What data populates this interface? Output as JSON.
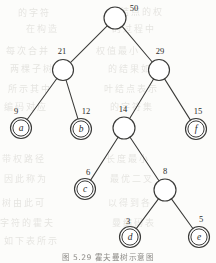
{
  "figure": {
    "caption": "图 5.29  霍夫曼树示意图",
    "kind": "huffman-tree-diagram"
  },
  "bleed_through": [
    {
      "text": "的字符",
      "x": 18,
      "y": 6
    },
    {
      "text": "结点的权",
      "x": 120,
      "y": 5
    },
    {
      "text": "在构造",
      "x": 26,
      "y": 22
    },
    {
      "text": "的过程中",
      "x": 112,
      "y": 22
    },
    {
      "text": "每次合并",
      "x": 6,
      "y": 44
    },
    {
      "text": "权值最小",
      "x": 96,
      "y": 44
    },
    {
      "text": "两棵子树",
      "x": 10,
      "y": 62
    },
    {
      "text": "的结果如",
      "x": 108,
      "y": 62
    },
    {
      "text": "所示其中",
      "x": 8,
      "y": 82
    },
    {
      "text": "叶结点表示",
      "x": 104,
      "y": 82
    },
    {
      "text": "编码对应",
      "x": 4,
      "y": 100
    },
    {
      "text": "的字符集",
      "x": 110,
      "y": 100
    },
    {
      "text": "带权路径",
      "x": 2,
      "y": 152
    },
    {
      "text": "长度最小",
      "x": 106,
      "y": 152
    },
    {
      "text": "因此称为",
      "x": 4,
      "y": 172
    },
    {
      "text": "最优二叉",
      "x": 110,
      "y": 172
    },
    {
      "text": "树由此可",
      "x": 2,
      "y": 196
    },
    {
      "text": "以得到各",
      "x": 108,
      "y": 196
    },
    {
      "text": "字符的霍夫",
      "x": 0,
      "y": 216
    },
    {
      "text": "曼编码表",
      "x": 112,
      "y": 216
    },
    {
      "text": "如下表所示",
      "x": 4,
      "y": 234
    }
  ],
  "tree": {
    "stroke_color": "#3a3a38",
    "node_fill": "#ffffff",
    "nodes": [
      {
        "id": "root",
        "type": "internal",
        "weight": "50",
        "label": "",
        "x": 115,
        "y": 18,
        "r": 11,
        "weight_x": 134,
        "weight_y": 11
      },
      {
        "id": "n21",
        "type": "internal",
        "weight": "21",
        "label": "",
        "x": 63,
        "y": 70,
        "r": 10.5,
        "weight_x": 62,
        "weight_y": 54
      },
      {
        "id": "n29",
        "type": "internal",
        "weight": "29",
        "label": "",
        "x": 159,
        "y": 70,
        "r": 10.5,
        "weight_x": 160,
        "weight_y": 54
      },
      {
        "id": "leafA",
        "type": "leaf",
        "weight": "9",
        "label": "a",
        "x": 21,
        "y": 128,
        "r": 10.5,
        "weight_x": 16,
        "weight_y": 114
      },
      {
        "id": "leafB",
        "type": "leaf",
        "weight": "12",
        "label": "b",
        "x": 81,
        "y": 129,
        "r": 10.5,
        "weight_x": 86,
        "weight_y": 114
      },
      {
        "id": "n14",
        "type": "internal",
        "weight": "14",
        "label": "",
        "x": 124,
        "y": 128,
        "r": 11,
        "weight_x": 123,
        "weight_y": 112
      },
      {
        "id": "leafF",
        "type": "leaf",
        "weight": "15",
        "label": "f",
        "x": 196,
        "y": 129,
        "r": 10.5,
        "weight_x": 198,
        "weight_y": 114
      },
      {
        "id": "leafC",
        "type": "leaf",
        "weight": "6",
        "label": "c",
        "x": 85,
        "y": 189,
        "r": 10.5,
        "weight_x": 88,
        "weight_y": 175
      },
      {
        "id": "n8",
        "type": "internal",
        "weight": "8",
        "label": "",
        "x": 165,
        "y": 190,
        "r": 11,
        "weight_x": 165,
        "weight_y": 174
      },
      {
        "id": "leafD",
        "type": "leaf",
        "weight": "3",
        "label": "d",
        "x": 130,
        "y": 237,
        "r": 10.5,
        "weight_x": 128,
        "weight_y": 224
      },
      {
        "id": "leafE",
        "type": "leaf",
        "weight": "5",
        "label": "e",
        "x": 199,
        "y": 237,
        "r": 10.5,
        "weight_x": 201,
        "weight_y": 222
      }
    ],
    "edges": [
      {
        "from": "root",
        "to": "n21"
      },
      {
        "from": "root",
        "to": "n29"
      },
      {
        "from": "n21",
        "to": "leafA"
      },
      {
        "from": "n21",
        "to": "leafB"
      },
      {
        "from": "n29",
        "to": "n14"
      },
      {
        "from": "n29",
        "to": "leafF"
      },
      {
        "from": "n14",
        "to": "leafC"
      },
      {
        "from": "n14",
        "to": "n8"
      },
      {
        "from": "n8",
        "to": "leafD"
      },
      {
        "from": "n8",
        "to": "leafE"
      }
    ]
  },
  "chart_data": {
    "type": "diagram",
    "title": "图 5.29  霍夫曼树示意图",
    "structure": "binary-huffman-tree",
    "root_weight": 50,
    "leaves": [
      {
        "symbol": "a",
        "weight": 9
      },
      {
        "symbol": "b",
        "weight": 12
      },
      {
        "symbol": "c",
        "weight": 6
      },
      {
        "symbol": "d",
        "weight": 3
      },
      {
        "symbol": "e",
        "weight": 5
      },
      {
        "symbol": "f",
        "weight": 15
      }
    ],
    "internal_weights": [
      50,
      21,
      29,
      14,
      8
    ]
  }
}
